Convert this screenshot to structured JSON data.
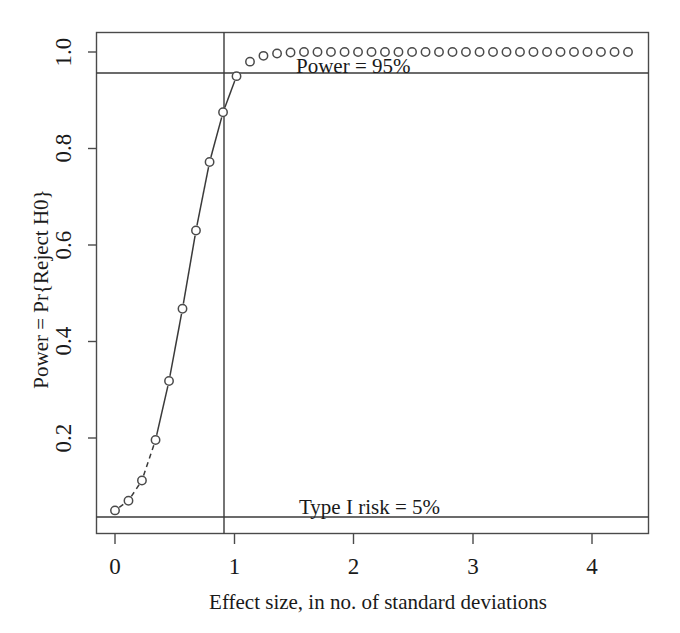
{
  "chart_data": {
    "type": "scatter",
    "title": "",
    "xlabel": "Effect size, in no. of standard deviations",
    "ylabel": "Power = Pr{Reject H0}",
    "xlim": [
      -0.1,
      4.47
    ],
    "ylim": [
      0.012,
      1.035
    ],
    "grid": false,
    "legend": null,
    "marker": "open-circle",
    "line_style_left_segment": "dashed-to-solid",
    "xticks": [
      0,
      1,
      2,
      3,
      4
    ],
    "xtick_labels": [
      "0",
      "1",
      "2",
      "3",
      "4"
    ],
    "yticks": [
      0.2,
      0.4,
      0.6,
      0.8,
      1.0
    ],
    "ytick_labels": [
      "0.2",
      "0.4",
      "0.6",
      "0.8",
      "1.0"
    ],
    "x": [
      0.0,
      0.113,
      0.226,
      0.34,
      0.453,
      0.566,
      0.679,
      0.793,
      0.906,
      1.019,
      1.132,
      1.245,
      1.359,
      1.472,
      1.585,
      1.698,
      1.811,
      1.925,
      2.038,
      2.151,
      2.264,
      2.377,
      2.491,
      2.604,
      2.717,
      2.83,
      2.943,
      3.057,
      3.17,
      3.283,
      3.396,
      3.509,
      3.623,
      3.736,
      3.849,
      3.962,
      4.075,
      4.189,
      4.302
    ],
    "y": [
      0.05,
      0.07,
      0.112,
      0.196,
      0.318,
      0.468,
      0.63,
      0.772,
      0.875,
      0.95,
      0.98,
      0.992,
      0.997,
      0.999,
      1.0,
      1.0,
      1.0,
      1.0,
      1.0,
      1.0,
      1.0,
      1.0,
      1.0,
      1.0,
      1.0,
      1.0,
      1.0,
      1.0,
      1.0,
      1.0,
      1.0,
      1.0,
      1.0,
      1.0,
      1.0,
      1.0,
      1.0,
      1.0,
      1.0
    ],
    "reference_lines": [
      {
        "name": "power-line",
        "orientation": "horizontal",
        "value": 0.95,
        "label": "Power = 95%"
      },
      {
        "name": "type-i-risk-line",
        "orientation": "horizontal",
        "value": 0.05,
        "label": "Type I risk = 5%"
      },
      {
        "name": "required-effect-size-line",
        "orientation": "vertical",
        "value": 0.906,
        "label": ""
      }
    ],
    "annotations": [
      {
        "name": "power-annotation",
        "text": "Power = 95%",
        "x": 1.55,
        "y": 0.963
      },
      {
        "name": "type-i-risk-annotation",
        "text": "Type I risk = 5%",
        "x": 1.55,
        "y": 0.073
      }
    ],
    "colors": {
      "axis": "#3a3a3a",
      "marker": "#4a4a4a",
      "line": "#3a3a3a",
      "text": "#1a1a1a",
      "background": "#ffffff"
    }
  },
  "axes": {
    "x_title": "Effect size, in no. of standard deviations",
    "y_title": "Power = Pr{Reject H0}",
    "x_tick_labels": [
      "0",
      "1",
      "2",
      "3",
      "4"
    ],
    "y_tick_labels": [
      "0.2",
      "0.4",
      "0.6",
      "0.8",
      "1.0"
    ]
  },
  "annotations": {
    "power": "Power = 95%",
    "type_i_risk": "Type I risk = 5%"
  }
}
